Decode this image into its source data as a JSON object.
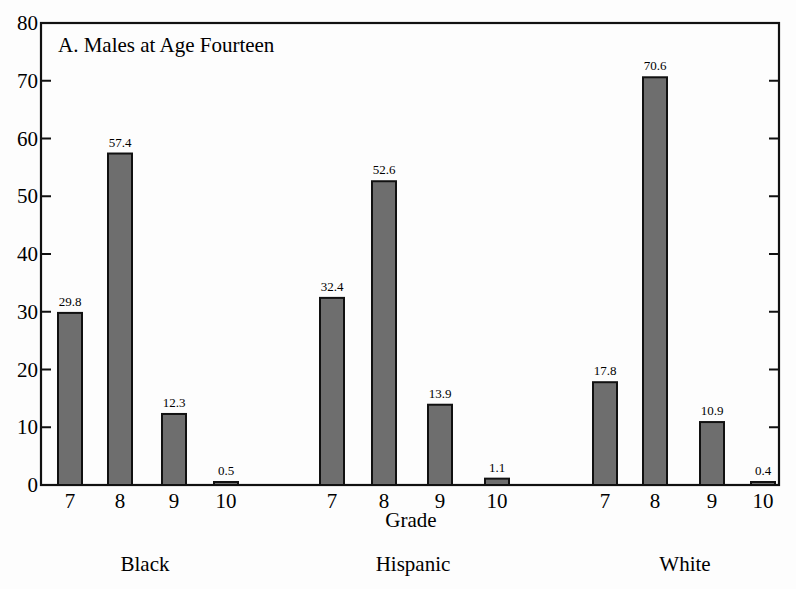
{
  "chart_data": {
    "type": "bar",
    "title": "A.  Males at Age Fourteen",
    "xlabel": "Grade",
    "ylabel": "",
    "ylim": [
      0,
      80
    ],
    "yticks": [
      0,
      10,
      20,
      30,
      40,
      50,
      60,
      70,
      80
    ],
    "grid": false,
    "legend": null,
    "groups": [
      "Black",
      "Hispanic",
      "White"
    ],
    "categories": [
      "7",
      "8",
      "9",
      "10"
    ],
    "series": [
      {
        "name": "Black",
        "values": [
          29.8,
          57.4,
          12.3,
          0.5
        ]
      },
      {
        "name": "Hispanic",
        "values": [
          32.4,
          52.6,
          13.9,
          1.1
        ]
      },
      {
        "name": "White",
        "values": [
          17.8,
          70.6,
          10.9,
          0.4
        ]
      }
    ],
    "bar_color": "#6e6e6e",
    "bar_edge_color": "#111111"
  }
}
